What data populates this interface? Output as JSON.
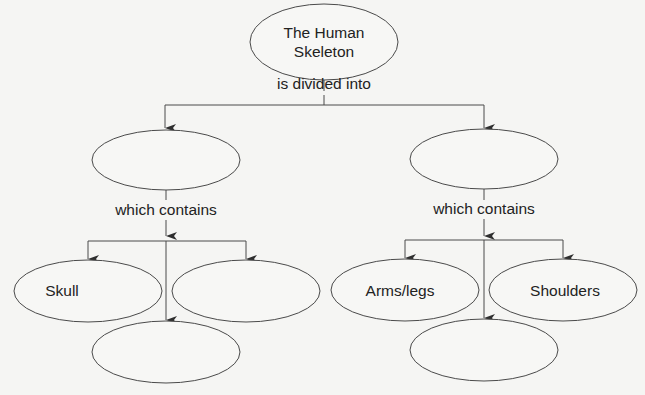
{
  "diagram": {
    "type": "concept-map",
    "root": {
      "label_line1": "The Human",
      "label_line2": "Skeleton"
    },
    "root_link": "is divided into",
    "branches": [
      {
        "label": "",
        "link": "which contains",
        "children": [
          {
            "label": "Skull"
          },
          {
            "label": ""
          },
          {
            "label": ""
          }
        ]
      },
      {
        "label": "",
        "link": "which contains",
        "children": [
          {
            "label": "Arms/legs"
          },
          {
            "label": ""
          },
          {
            "label": "Shoulders"
          }
        ]
      }
    ]
  },
  "colors": {
    "line": "#4a4a4a",
    "background": "#f5f5f3",
    "text": "#222222"
  }
}
